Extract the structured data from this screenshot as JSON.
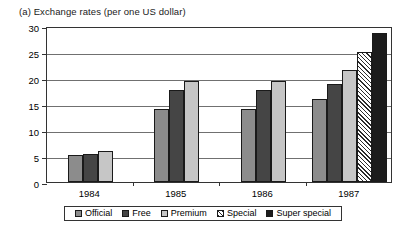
{
  "chart_data": {
    "type": "bar",
    "title": "(a) Exchange rates (per one US dollar)",
    "xlabel": "",
    "ylabel": "",
    "categories": [
      "1984",
      "1985",
      "1986",
      "1987"
    ],
    "series": [
      {
        "name": "Official",
        "color": "#8c8c8c",
        "pattern": "solid",
        "values": [
          5.2,
          14.0,
          14.0,
          16.0
        ]
      },
      {
        "name": "Free",
        "color": "#454545",
        "pattern": "solid",
        "values": [
          5.4,
          17.6,
          17.6,
          18.8
        ]
      },
      {
        "name": "Premium",
        "color": "#c6c6c6",
        "pattern": "solid",
        "values": [
          6.0,
          19.4,
          19.4,
          21.6
        ]
      },
      {
        "name": "Special",
        "color": "#ffffff",
        "pattern": "diagonal",
        "values": [
          null,
          null,
          null,
          25.0
        ]
      },
      {
        "name": "Super special",
        "color": "#1c1c1c",
        "pattern": "solid",
        "values": [
          null,
          null,
          null,
          28.6
        ]
      }
    ],
    "ylim": [
      0,
      30
    ],
    "yticks": [
      0,
      5,
      10,
      15,
      20,
      25,
      30
    ],
    "ytick_labels": [
      "0",
      "5",
      "10",
      "15",
      "20",
      "25",
      "30"
    ],
    "grid": true,
    "legend_position": "bottom"
  },
  "legend": {
    "items": [
      {
        "label": "Official"
      },
      {
        "label": "Free"
      },
      {
        "label": "Premium"
      },
      {
        "label": "Special"
      },
      {
        "label": "Super special"
      }
    ]
  }
}
